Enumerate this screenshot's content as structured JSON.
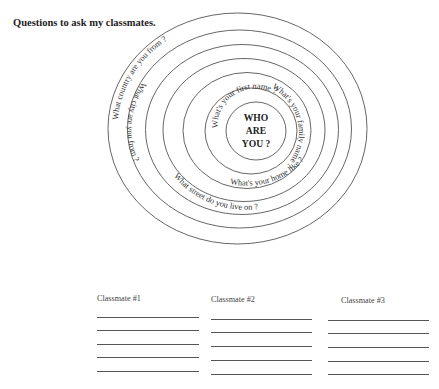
{
  "title": "Questions to ask my classmates.",
  "target": {
    "center_lines": [
      "WHO",
      "ARE",
      "YOU ?"
    ],
    "rings": [
      {
        "cx": 237.5,
        "cy": 128.5,
        "rx": 129.5,
        "ry": 115.5
      },
      {
        "cx": 239.5,
        "cy": 129,
        "rx": 112,
        "ry": 99
      },
      {
        "cx": 242,
        "cy": 129.5,
        "rx": 96.5,
        "ry": 85
      },
      {
        "cx": 244,
        "cy": 130,
        "rx": 81,
        "ry": 71.5
      },
      {
        "cx": 247,
        "cy": 130.5,
        "rx": 64,
        "ry": 58
      },
      {
        "cx": 251,
        "cy": 131,
        "rx": 46,
        "ry": 43
      },
      {
        "cx": 256,
        "cy": 131,
        "rx": 30,
        "ry": 29
      }
    ],
    "questions": [
      {
        "id": "country",
        "text": "What country are you from ?"
      },
      {
        "id": "city",
        "text": "What city are you from ?"
      },
      {
        "id": "street",
        "text": "What street do you live on ?"
      },
      {
        "id": "home",
        "text": "What's your home like ?"
      },
      {
        "id": "family",
        "text": "What's your family name ?"
      },
      {
        "id": "first",
        "text": "What's your first name ?"
      }
    ]
  },
  "classmates": [
    {
      "label": "Classmate #1"
    },
    {
      "label": "Classmate #2"
    },
    {
      "label": "Classmate #3"
    }
  ]
}
